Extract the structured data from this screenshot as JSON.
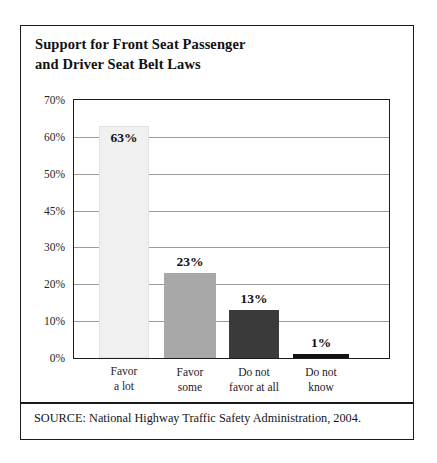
{
  "figure": {
    "title_lines": [
      "Support for Front Seat Passenger",
      "and Driver Seat Belt Laws"
    ],
    "source_note": "SOURCE: National Highway Traffic Safety Administration, 2004."
  },
  "chart_data": {
    "type": "bar",
    "title": "Support for Front Seat Passenger and Driver Seat Belt Laws",
    "xlabel": "",
    "ylabel": "",
    "categories": [
      "Favor a lot",
      "Favor some",
      "Do not favor at all",
      "Do not know"
    ],
    "category_lines": [
      [
        "Favor",
        "a lot"
      ],
      [
        "Favor",
        "some"
      ],
      [
        "Do not",
        "favor at all"
      ],
      [
        "Do not",
        "know"
      ]
    ],
    "values": [
      63,
      23,
      13,
      1
    ],
    "value_labels": [
      "63%",
      "23%",
      "13%",
      "1%"
    ],
    "bar_colors": [
      "#f0f0f0",
      "#a8a8a8",
      "#3a3a3a",
      "#111111"
    ],
    "ylim": [
      0,
      70
    ],
    "ytick_labels": [
      "70%",
      "60%",
      "50%",
      "45%",
      "30%",
      "20%",
      "10%",
      "0%"
    ],
    "grid": true,
    "legend": "none"
  }
}
